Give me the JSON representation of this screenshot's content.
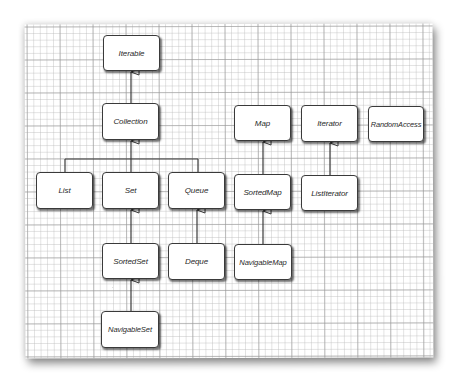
{
  "diagram": {
    "type": "uml-interface-hierarchy",
    "nodes": [
      {
        "id": "iterable",
        "label": "Iterable",
        "x": 103,
        "y": 35,
        "w": 57,
        "h": 36
      },
      {
        "id": "collection",
        "label": "Collection",
        "x": 102,
        "y": 103,
        "w": 57,
        "h": 37
      },
      {
        "id": "list",
        "label": "List",
        "x": 36,
        "y": 172,
        "w": 57,
        "h": 37
      },
      {
        "id": "set",
        "label": "Set",
        "x": 102,
        "y": 172,
        "w": 57,
        "h": 37
      },
      {
        "id": "queue",
        "label": "Queue",
        "x": 168,
        "y": 172,
        "w": 57,
        "h": 37
      },
      {
        "id": "map",
        "label": "Map",
        "x": 234,
        "y": 105,
        "w": 57,
        "h": 36
      },
      {
        "id": "iterator",
        "label": "Iterator",
        "x": 301,
        "y": 105,
        "w": 57,
        "h": 37
      },
      {
        "id": "randomaccess",
        "label": "RandomAccess",
        "x": 368,
        "y": 106,
        "w": 56,
        "h": 36
      },
      {
        "id": "sortedmap",
        "label": "SortedMap",
        "x": 234,
        "y": 174,
        "w": 57,
        "h": 36
      },
      {
        "id": "listiterator",
        "label": "ListIterator",
        "x": 301,
        "y": 175,
        "w": 57,
        "h": 36
      },
      {
        "id": "sortedset",
        "label": "SortedSet",
        "x": 102,
        "y": 243,
        "w": 57,
        "h": 36
      },
      {
        "id": "deque",
        "label": "Deque",
        "x": 168,
        "y": 243,
        "w": 57,
        "h": 37
      },
      {
        "id": "navigablemap",
        "label": "NavigableMap",
        "x": 234,
        "y": 244,
        "w": 58,
        "h": 36
      },
      {
        "id": "navigableset",
        "label": "NavigableSet",
        "x": 101,
        "y": 311,
        "w": 58,
        "h": 37
      }
    ],
    "edges": [
      {
        "from": "collection",
        "to": "iterable",
        "kind": "generalization"
      },
      {
        "from": "list",
        "to": "collection",
        "kind": "generalization"
      },
      {
        "from": "set",
        "to": "collection",
        "kind": "generalization"
      },
      {
        "from": "queue",
        "to": "collection",
        "kind": "generalization"
      },
      {
        "from": "sortedset",
        "to": "set",
        "kind": "generalization"
      },
      {
        "from": "navigableset",
        "to": "sortedset",
        "kind": "generalization"
      },
      {
        "from": "deque",
        "to": "queue",
        "kind": "generalization"
      },
      {
        "from": "sortedmap",
        "to": "map",
        "kind": "generalization"
      },
      {
        "from": "navigablemap",
        "to": "sortedmap",
        "kind": "generalization"
      },
      {
        "from": "listiterator",
        "to": "iterator",
        "kind": "generalization"
      }
    ]
  },
  "colors": {
    "box_border": "#3a3a3a",
    "box_fill": "#ffffff",
    "line": "#3a3a3a",
    "text": "#2a2a2a",
    "grid_major": "#969696",
    "grid_minor": "#bebebe"
  }
}
